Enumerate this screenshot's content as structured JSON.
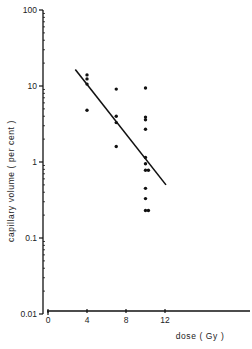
{
  "chart_data": {
    "type": "scatter",
    "title": "",
    "xlabel": "dose ( Gy )",
    "ylabel": "capillary volume ( per cent )",
    "xscale": "linear",
    "yscale": "log",
    "xlim": [
      0,
      21
    ],
    "ylim": [
      0.01,
      100
    ],
    "xticks": [
      0,
      4,
      8,
      12
    ],
    "xtick_labels": [
      "0",
      "4",
      "8",
      "12"
    ],
    "yticks": [
      0.01,
      0.1,
      1,
      10,
      100
    ],
    "ytick_labels": [
      "0.01",
      "0.1",
      "1",
      "10",
      "100"
    ],
    "grid": false,
    "legend": null,
    "series": [
      {
        "name": "observations",
        "kind": "points",
        "points": [
          {
            "x": 4,
            "y": 14
          },
          {
            "x": 4,
            "y": 12.4
          },
          {
            "x": 4,
            "y": 10.6
          },
          {
            "x": 4,
            "y": 4.8
          },
          {
            "x": 7,
            "y": 9.1
          },
          {
            "x": 7,
            "y": 4.0
          },
          {
            "x": 7,
            "y": 3.3
          },
          {
            "x": 7,
            "y": 1.6
          },
          {
            "x": 10,
            "y": 9.4
          },
          {
            "x": 10,
            "y": 3.9
          },
          {
            "x": 10,
            "y": 3.6
          },
          {
            "x": 10,
            "y": 2.7
          },
          {
            "x": 10,
            "y": 1.15
          },
          {
            "x": 10,
            "y": 0.95
          },
          {
            "x": 10,
            "y": 0.78
          },
          {
            "x": 10.3,
            "y": 0.78
          },
          {
            "x": 10,
            "y": 0.45
          },
          {
            "x": 10,
            "y": 0.33
          },
          {
            "x": 10,
            "y": 0.23
          },
          {
            "x": 10.3,
            "y": 0.23
          }
        ]
      },
      {
        "name": "regression line",
        "kind": "line",
        "points": [
          {
            "x": 2.8,
            "y": 16.5
          },
          {
            "x": 12.1,
            "y": 0.5
          }
        ]
      }
    ]
  }
}
